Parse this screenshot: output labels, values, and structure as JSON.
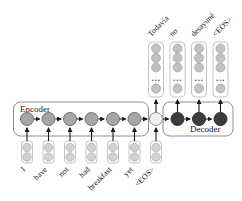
{
  "diagram": {
    "encoder": {
      "label": "Encoder",
      "input_tokens": [
        "I",
        "have",
        "not",
        "had",
        "breakfast",
        "yet",
        "<EOS>"
      ]
    },
    "decoder": {
      "label": "Decoder",
      "output_tokens": [
        "Todavía",
        "no",
        "desayuné",
        "<EOS>"
      ]
    },
    "ellipsis": "...",
    "colors": {
      "encoder_state": "#a6a6a6",
      "context_state": "#efefef",
      "decoder_state": "#3c3c3c",
      "embedding_circle": "#d2d2d2",
      "output_circle": "#c2c2c2",
      "box_border": "#8f8f8f",
      "arrow": "#1a1a1a",
      "text": "#1a1a1a"
    }
  }
}
